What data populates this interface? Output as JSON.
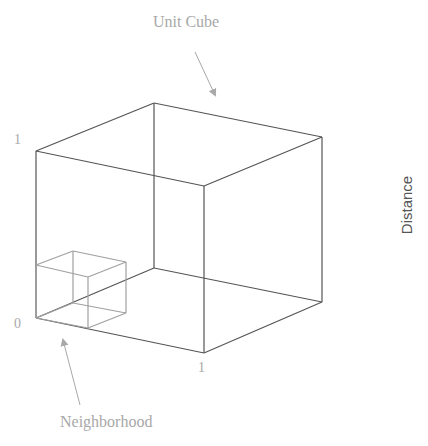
{
  "diagram": {
    "title_label": "Unit Cube",
    "neighborhood_label": "Neighborhood",
    "side_label": "Distance",
    "ticks": {
      "top_left": "1",
      "origin": "0",
      "bottom_right": "1"
    },
    "colors": {
      "cube_edge": "#555555",
      "neighborhood_edge": "#a0a0a0",
      "annotation": "#a8a8a8"
    }
  }
}
